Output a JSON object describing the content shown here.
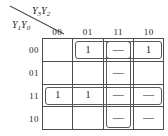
{
  "diagram": {
    "type": "karnaugh-map",
    "title": "",
    "column_axis_label": "Y3Y2",
    "row_axis_label": "Y1Y0",
    "column_axis_label_parts": {
      "v1": "Y",
      "s1": "3",
      "v2": "Y",
      "s2": "2"
    },
    "row_axis_label_parts": {
      "v1": "Y",
      "s1": "1",
      "v2": "Y",
      "s2": "0"
    },
    "columns": [
      "00",
      "01",
      "11",
      "10"
    ],
    "rows": [
      "00",
      "01",
      "11",
      "10"
    ],
    "cells": [
      [
        "",
        "1",
        "—",
        "1"
      ],
      [
        "",
        "",
        "—",
        ""
      ],
      [
        "1",
        "1",
        "—",
        "—"
      ],
      [
        "",
        "",
        "—",
        "—"
      ]
    ],
    "groups": [
      {
        "name": "group-row00-cols01to10",
        "row_start": 0,
        "row_end": 0,
        "col_start": 1,
        "col_end": 3
      },
      {
        "name": "group-row11-all-cols",
        "row_start": 2,
        "row_end": 2,
        "col_start": 0,
        "col_end": 3
      },
      {
        "name": "group-col11-all-rows",
        "row_start": 0,
        "row_end": 3,
        "col_start": 2,
        "col_end": 2
      },
      {
        "name": "group-cell-row00-col11",
        "row_start": 0,
        "row_end": 0,
        "col_start": 2,
        "col_end": 2
      }
    ],
    "colors": {
      "grid_line": "#4d4d4d",
      "group_outline": "#595959",
      "text": "#1a1a1a",
      "background": "#ffffff"
    }
  }
}
